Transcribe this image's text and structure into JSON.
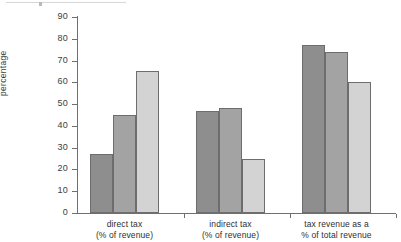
{
  "chart_data": {
    "type": "bar",
    "title": "",
    "xlabel": "",
    "ylabel": "percentage",
    "ylim": [
      0,
      90
    ],
    "yticks": [
      0,
      10,
      20,
      30,
      40,
      50,
      60,
      70,
      80,
      90
    ],
    "ytick_labels": [
      "0",
      "10",
      "20",
      "30",
      "40",
      "50",
      "60",
      "70",
      "80",
      "90"
    ],
    "grid": false,
    "legend": "none",
    "categories": [
      "direct tax\n(% of revenue)",
      "indirect tax\n(% of revenue)",
      "tax revenue as a\n% of total revenue"
    ],
    "category_lines": [
      [
        "direct tax",
        "(% of revenue)"
      ],
      [
        "indirect tax",
        "(% of revenue)"
      ],
      [
        "tax revenue as a",
        "% of total revenue"
      ]
    ],
    "series": [
      {
        "name": "series-1",
        "color": "#8e8e8e",
        "values": [
          27,
          47,
          77
        ]
      },
      {
        "name": "series-2",
        "color": "#a3a3a3",
        "values": [
          45,
          48,
          74
        ]
      },
      {
        "name": "series-3",
        "color": "#d3d3d3",
        "values": [
          65,
          25,
          60
        ]
      }
    ]
  },
  "colors": {
    "axis": "#6f6f6f",
    "text": "#3a3a3a",
    "bar_1": "#8e8e8e",
    "bar_2": "#a3a3a3",
    "bar_3": "#d3d3d3",
    "bar_border": "#6d6d6d",
    "background": "#ffffff"
  }
}
